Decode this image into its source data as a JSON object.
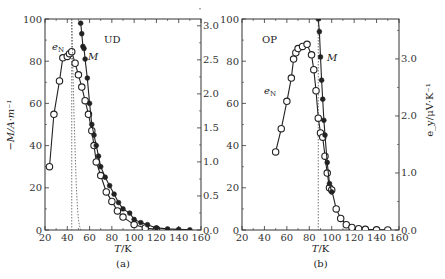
{
  "chart_data": [
    {
      "panel": "(a)",
      "type": "line",
      "annotation": "UD",
      "xlabel": "T/K",
      "ylabel_left": "−M/A·m⁻¹",
      "ylabel_right": "",
      "xlim": [
        20,
        160
      ],
      "ylim_left": [
        0,
        100
      ],
      "ylim_right": [
        0,
        3.1
      ],
      "xticks": [
        20,
        40,
        60,
        80,
        100,
        120,
        140,
        160
      ],
      "yticks_left": [
        0,
        20,
        40,
        60,
        80,
        100
      ],
      "yticks_right": [
        "0.0",
        "0.5",
        "1.0",
        "1.5",
        "2.0",
        "2.5",
        "3.0"
      ],
      "vline_dotted_T": 44,
      "series": [
        {
          "name": "e_N",
          "axis": "right",
          "marker": "open-circle",
          "x": [
            24,
            28,
            33,
            36,
            40,
            42,
            44,
            47,
            50,
            53,
            56,
            59,
            62,
            64,
            66,
            70,
            75,
            80,
            85,
            90,
            100,
            110,
            120
          ],
          "y": [
            0.93,
            1.7,
            2.19,
            2.53,
            2.55,
            2.59,
            2.62,
            2.45,
            2.28,
            2.1,
            1.9,
            1.7,
            1.46,
            1.24,
            1.0,
            0.8,
            0.56,
            0.42,
            0.28,
            0.19,
            0.08,
            0.03,
            0.01
          ]
        },
        {
          "name": "M",
          "axis": "left",
          "marker": "filled-circle",
          "x": [
            52,
            53,
            54,
            55,
            56,
            58,
            60,
            62,
            64,
            66,
            68,
            70,
            74,
            78,
            82,
            86,
            90,
            96,
            100,
            106,
            112,
            120,
            130,
            140,
            150
          ],
          "y": [
            98,
            93,
            87,
            86,
            81,
            72,
            60,
            50,
            45,
            40,
            35,
            30,
            25,
            21,
            17,
            13,
            10,
            8,
            5,
            3.5,
            2.5,
            1,
            0.5,
            0.3,
            0.1
          ]
        },
        {
          "name": "M_fit",
          "axis": "left",
          "style": "dotted",
          "x": [
            44,
            44.5,
            45,
            46,
            47,
            48,
            49,
            50,
            51,
            52
          ],
          "y": [
            100,
            90,
            75,
            55,
            38,
            22,
            12,
            5,
            2,
            0
          ]
        }
      ],
      "labels": [
        "e_N",
        "M",
        "UD"
      ]
    },
    {
      "panel": "(b)",
      "type": "line",
      "annotation": "OP",
      "xlabel": "T/K",
      "ylabel_left": "",
      "ylabel_right": "e_y/μV·K⁻¹",
      "xlim": [
        20,
        160
      ],
      "ylim_left": [
        0,
        100
      ],
      "ylim_right": [
        0,
        3.7
      ],
      "xticks": [
        20,
        40,
        60,
        80,
        100,
        120,
        140,
        160
      ],
      "yticks_left": [
        0,
        20,
        40,
        60,
        80,
        100
      ],
      "yticks_right": [
        "0.0",
        "1.0",
        "2.0",
        "3.0"
      ],
      "vline_dotted_T": 88,
      "series": [
        {
          "name": "e_N",
          "axis": "left",
          "marker": "open-circle",
          "x": [
            50,
            55,
            60,
            64,
            66,
            68,
            70,
            74,
            78,
            82,
            84,
            86,
            88,
            90,
            92,
            94,
            96,
            98,
            100,
            104,
            108,
            113,
            118,
            124,
            130,
            140,
            150
          ],
          "y": [
            37,
            48,
            61,
            72,
            81,
            84,
            86,
            87,
            88,
            83,
            76,
            66,
            53,
            46,
            44,
            35,
            27,
            20,
            19,
            10,
            5.5,
            2.5,
            1.2,
            0.6,
            0.3,
            0.1,
            0.05
          ]
        },
        {
          "name": "M",
          "axis": "left",
          "marker": "filled-circle",
          "x": [
            88,
            89,
            90,
            91,
            92,
            93,
            94,
            96,
            98,
            100
          ],
          "y": [
            100,
            94,
            82,
            71,
            62,
            52,
            45,
            32,
            22,
            18
          ]
        }
      ],
      "labels": [
        "e_N",
        "M",
        "OP"
      ]
    }
  ],
  "panels": {
    "a": {
      "caption": "(a)",
      "tag": "UD",
      "xlabel_T": "T",
      "xlabel_unit": "/K",
      "ylabel_left": "−M/A·m⁻¹",
      "label_eN": "e",
      "label_eN_sub": "N",
      "label_M": "M",
      "xticks": [
        "20",
        "40",
        "60",
        "80",
        "100",
        "120",
        "140",
        "160"
      ],
      "yticks_left": [
        "0",
        "20",
        "40",
        "60",
        "80",
        "100"
      ],
      "yticks_right": [
        "0.0",
        "0.5",
        "1.0",
        "1.5",
        "2.0",
        "2.5",
        "3.0"
      ]
    },
    "b": {
      "caption": "(b)",
      "tag": "OP",
      "xlabel_T": "T",
      "xlabel_unit": "/K",
      "ylabel_right": "e_y/μV·K⁻¹",
      "label_eN": "e",
      "label_eN_sub": "N",
      "label_M": "M",
      "xticks": [
        "20",
        "40",
        "60",
        "80",
        "100",
        "120",
        "140",
        "160"
      ],
      "yticks_left": [
        "0",
        "20",
        "40",
        "60",
        "80",
        "100"
      ],
      "yticks_right": [
        "0.0",
        "1.0",
        "2.0",
        "3.0"
      ]
    }
  }
}
